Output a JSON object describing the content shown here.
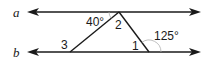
{
  "diagram": {
    "type": "geometry",
    "lines": [
      {
        "name": "a",
        "label": "a"
      },
      {
        "name": "b",
        "label": "b"
      }
    ],
    "angles": {
      "given_top": {
        "label": "40°"
      },
      "angle_2": {
        "label": "2"
      },
      "angle_3": {
        "label": "3"
      },
      "angle_1": {
        "label": "1"
      },
      "exterior": {
        "label": "125°"
      }
    },
    "colors": {
      "stroke": "#1a1a1a",
      "arc": "#b0b0b0",
      "background": "#ffffff"
    }
  }
}
